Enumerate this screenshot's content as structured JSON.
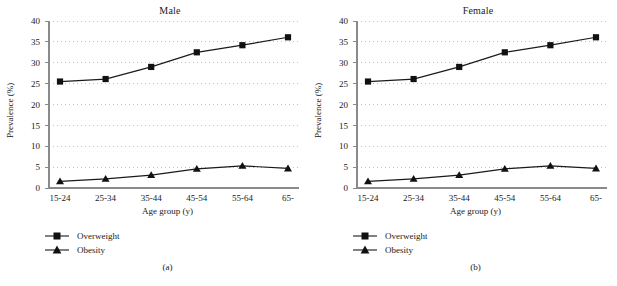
{
  "figure": {
    "background": "#ffffff",
    "line_color": "#1a1a1a",
    "grid_color": "#b9b9c9",
    "axis_color": "#8a8a8a"
  },
  "panels": [
    {
      "caption": "(a)",
      "title": "Male",
      "xlabel": "Age group (y)",
      "ylabel": "Prevalence (%)",
      "legend": [
        {
          "label": "Overweight",
          "marker": "square"
        },
        {
          "label": "Obesity",
          "marker": "triangle"
        }
      ]
    },
    {
      "caption": "(b)",
      "title": "Female",
      "xlabel": "Age group (y)",
      "ylabel": "Prevalence (%)",
      "legend": [
        {
          "label": "Overweight",
          "marker": "square"
        },
        {
          "label": "Obesity",
          "marker": "triangle"
        }
      ]
    }
  ],
  "chart_data": [
    {
      "type": "line",
      "title": "Male",
      "xlabel": "Age group (y)",
      "ylabel": "Prevalence (%)",
      "categories": [
        "15-24",
        "25-34",
        "35-44",
        "45-54",
        "55-64",
        "65-"
      ],
      "yticks": [
        0,
        5,
        10,
        15,
        20,
        25,
        30,
        35,
        40
      ],
      "ylim": [
        0,
        40
      ],
      "grid": "horizontal-dotted",
      "legend_position": "below-axes-left",
      "series": [
        {
          "name": "Overweight",
          "marker": "square",
          "values": [
            25.5,
            26.1,
            29.0,
            32.5,
            34.2,
            36.1
          ]
        },
        {
          "name": "Obesity",
          "marker": "triangle",
          "values": [
            1.6,
            2.2,
            3.1,
            4.6,
            5.3,
            4.7
          ]
        }
      ]
    },
    {
      "type": "line",
      "title": "Female",
      "xlabel": "Age group (y)",
      "ylabel": "Prevalence (%)",
      "categories": [
        "15-24",
        "25-34",
        "35-44",
        "45-54",
        "55-64",
        "65-"
      ],
      "yticks": [
        0,
        5,
        10,
        15,
        20,
        25,
        30,
        35,
        40
      ],
      "ylim": [
        0,
        40
      ],
      "grid": "horizontal-dotted",
      "legend_position": "below-axes-left",
      "series": [
        {
          "name": "Overweight",
          "marker": "square",
          "values": [
            25.5,
            26.1,
            29.0,
            32.5,
            34.2,
            36.1
          ]
        },
        {
          "name": "Obesity",
          "marker": "triangle",
          "values": [
            1.6,
            2.2,
            3.1,
            4.6,
            5.3,
            4.7
          ]
        }
      ]
    }
  ]
}
